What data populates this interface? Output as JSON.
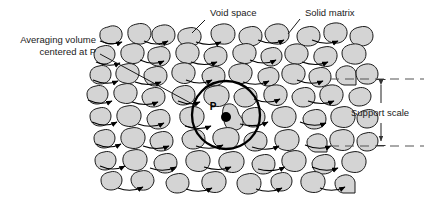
{
  "figure": {
    "title_labels": {
      "void_space": "Void space",
      "solid_matrix": "Solid matrix",
      "averaging_volume_line1": "Averaging volume",
      "averaging_volume_line2": "centered at P",
      "support_scale": "Support scale",
      "point_marker": "P"
    },
    "colors": {
      "grain_fill": "#d4d4d4",
      "grain_stroke": "#1a1a1a",
      "background": "#ffffff",
      "text": "#1a1a1a",
      "circle_stroke": "#000000",
      "arrow": "#000000",
      "dashed_line": "#555555"
    },
    "geometry": {
      "averaging_circle_center_x": 226,
      "averaging_circle_center_y": 115,
      "averaging_circle_radius": 34,
      "support_scale_top_y": 79,
      "support_scale_bottom_y": 146,
      "dimension_line_x": 381
    }
  }
}
